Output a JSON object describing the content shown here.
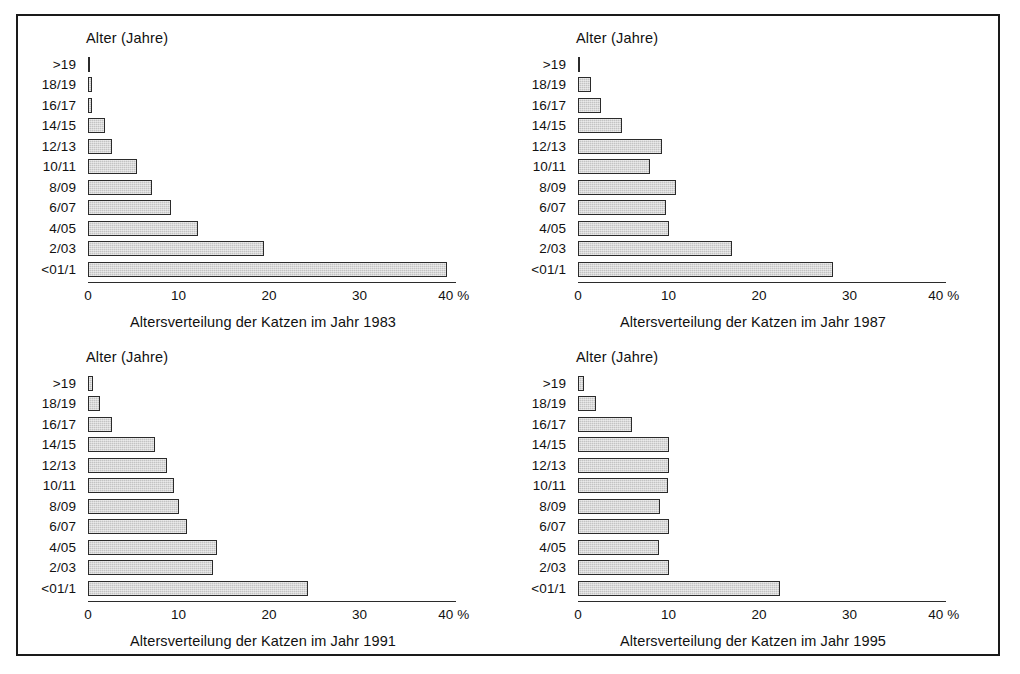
{
  "figure": {
    "background_color": "#ffffff",
    "border_color": "#1a1a1a",
    "bar_fill_color": "#c3c3c3",
    "bar_edge_color": "#2b2b2b"
  },
  "chart_data": [
    {
      "type": "bar",
      "orientation": "horizontal",
      "title": "",
      "xlabel": "Altersverteilung der Katzen im Jahr 1983",
      "ylabel": "Alter (Jahre)",
      "unit_label": "%",
      "categories": [
        ">19",
        "18/19",
        "16/17",
        "14/15",
        "12/13",
        "10/11",
        "8/09",
        "6/07",
        "4/05",
        "2/03",
        "<01/1"
      ],
      "values": [
        0.1,
        0.4,
        0.4,
        1.9,
        2.7,
        5.4,
        7.1,
        9.2,
        12.2,
        19.4,
        39.7
      ],
      "xlim": [
        0,
        40
      ],
      "xticks": [
        0,
        10,
        20,
        30,
        40
      ],
      "xtick_labels": [
        "0",
        "10",
        "20",
        "30",
        "40"
      ],
      "grid": false,
      "legend": false
    },
    {
      "type": "bar",
      "orientation": "horizontal",
      "title": "",
      "xlabel": "Altersverteilung der Katzen im Jahr 1987",
      "ylabel": "Alter (Jahre)",
      "unit_label": "%",
      "categories": [
        ">19",
        "18/19",
        "16/17",
        "14/15",
        "12/13",
        "10/11",
        "8/09",
        "6/07",
        "4/05",
        "2/03",
        "<01/1"
      ],
      "values": [
        0.2,
        1.4,
        2.5,
        4.9,
        9.3,
        8.0,
        10.8,
        9.7,
        10.1,
        17.0,
        28.2
      ],
      "xlim": [
        0,
        40
      ],
      "xticks": [
        0,
        10,
        20,
        30,
        40
      ],
      "xtick_labels": [
        "0",
        "10",
        "20",
        "30",
        "40"
      ],
      "grid": false,
      "legend": false
    },
    {
      "type": "bar",
      "orientation": "horizontal",
      "title": "",
      "xlabel": "Altersverteilung der Katzen im Jahr 1991",
      "ylabel": "Alter (Jahre)",
      "unit_label": "%",
      "categories": [
        ">19",
        "18/19",
        "16/17",
        "14/15",
        "12/13",
        "10/11",
        "8/09",
        "6/07",
        "4/05",
        "2/03",
        "<01/1"
      ],
      "values": [
        0.6,
        1.3,
        2.6,
        7.4,
        8.7,
        9.5,
        10.0,
        10.9,
        14.3,
        13.8,
        24.3
      ],
      "xlim": [
        0,
        40
      ],
      "xticks": [
        0,
        10,
        20,
        30,
        40
      ],
      "xtick_labels": [
        "0",
        "10",
        "20",
        "30",
        "40"
      ],
      "grid": false,
      "legend": false
    },
    {
      "type": "bar",
      "orientation": "horizontal",
      "title": "",
      "xlabel": "Altersverteilung der Katzen im Jahr 1995",
      "ylabel": "Alter (Jahre)",
      "unit_label": "%",
      "categories": [
        ">19",
        "18/19",
        "16/17",
        "14/15",
        "12/13",
        "10/11",
        "8/09",
        "6/07",
        "4/05",
        "2/03",
        "<01/1"
      ],
      "values": [
        0.7,
        2.0,
        6.0,
        10.0,
        10.1,
        9.9,
        9.1,
        10.0,
        9.0,
        10.0,
        22.3
      ],
      "xlim": [
        0,
        40
      ],
      "xticks": [
        0,
        10,
        20,
        30,
        40
      ],
      "xtick_labels": [
        "0",
        "10",
        "20",
        "30",
        "40"
      ],
      "grid": false,
      "legend": false
    }
  ]
}
